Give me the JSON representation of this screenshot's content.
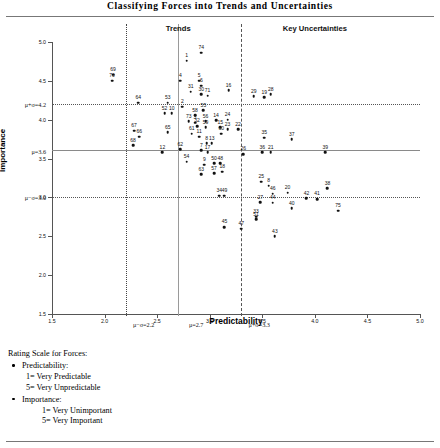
{
  "figure": {
    "title": "Classifying Forces into Trends and Uncertainties",
    "xaxis_title": "Predictability",
    "yaxis_title": "Importance"
  },
  "zones": [
    {
      "id": "trends",
      "label": "Trends"
    },
    {
      "id": "key-uncertainties",
      "label": "Key Uncertainties"
    }
  ],
  "footer": {
    "heading": "Rating Scale for Forces:",
    "items": [
      {
        "label": "Predictability:",
        "lines": [
          "1= Very Predictable",
          "5= Very Unpredictable"
        ],
        "indent": "sub"
      },
      {
        "label": "Importance:",
        "lines": [
          "1= Very Unimportant",
          "5= Very Important"
        ],
        "indent": "sub2"
      }
    ]
  },
  "chart_data": {
    "type": "scatter",
    "title": "Classifying Forces into Trends and Uncertainties",
    "xlabel": "Predictability",
    "ylabel": "Importance",
    "xlim": [
      1.5,
      5.0
    ],
    "ylim": [
      1.5,
      5.0
    ],
    "grid": false,
    "x_ticks": [
      "1.5",
      "2.0",
      "2.5",
      "3.0",
      "3.5",
      "4.0",
      "4.5",
      "5.0"
    ],
    "y_ticks": [
      "1.5",
      "2.0",
      "2.5",
      "3.0",
      "3.5",
      "4.0",
      "4.5",
      "5.0"
    ],
    "reference_lines": {
      "x": [
        {
          "label": "μ−σ=2.2",
          "value": 2.2,
          "style": "dotted"
        },
        {
          "label": "μ=2.7",
          "value": 2.7,
          "style": "solid"
        },
        {
          "label": "μ+σ=3.3",
          "value": 3.3,
          "style": "dashed"
        }
      ],
      "y": [
        {
          "label": "μ+σ=4.2",
          "value": 4.2,
          "style": "dotted"
        },
        {
          "label": "μ=3.6",
          "value": 3.6,
          "style": "solid"
        },
        {
          "label": "μ−σ=3.0",
          "value": 3.0,
          "style": "dotted"
        }
      ]
    },
    "points": [
      {
        "label": "69",
        "x": 2.08,
        "y": 4.58
      },
      {
        "label": "70",
        "x": 2.07,
        "y": 4.5
      },
      {
        "label": "64",
        "x": 2.32,
        "y": 4.22
      },
      {
        "label": "67",
        "x": 2.28,
        "y": 3.86
      },
      {
        "label": "66",
        "x": 2.33,
        "y": 3.78
      },
      {
        "label": "68",
        "x": 2.27,
        "y": 3.67
      },
      {
        "label": "12",
        "x": 2.55,
        "y": 3.58
      },
      {
        "label": "53",
        "x": 2.6,
        "y": 4.22
      },
      {
        "label": "52",
        "x": 2.57,
        "y": 4.08
      },
      {
        "label": "10",
        "x": 2.64,
        "y": 4.08
      },
      {
        "label": "65",
        "x": 2.6,
        "y": 3.84
      },
      {
        "label": "1",
        "x": 2.78,
        "y": 4.76
      },
      {
        "label": "74",
        "x": 2.92,
        "y": 4.86
      },
      {
        "label": "4",
        "x": 2.72,
        "y": 4.5
      },
      {
        "label": "5",
        "x": 2.9,
        "y": 4.5
      },
      {
        "label": "6",
        "x": 2.92,
        "y": 4.44
      },
      {
        "label": "31",
        "x": 2.82,
        "y": 4.36
      },
      {
        "label": "30",
        "x": 2.92,
        "y": 4.33
      },
      {
        "label": "71",
        "x": 2.98,
        "y": 4.31
      },
      {
        "label": "2",
        "x": 2.74,
        "y": 4.17
      },
      {
        "label": "55",
        "x": 2.94,
        "y": 4.12
      },
      {
        "label": "58",
        "x": 2.86,
        "y": 4.06
      },
      {
        "label": "73",
        "x": 2.8,
        "y": 3.98
      },
      {
        "label": "3",
        "x": 2.86,
        "y": 3.96
      },
      {
        "label": "32",
        "x": 2.88,
        "y": 3.92
      },
      {
        "label": "56",
        "x": 2.96,
        "y": 3.98
      },
      {
        "label": "59",
        "x": 2.96,
        "y": 3.9
      },
      {
        "label": "14",
        "x": 3.06,
        "y": 3.99
      },
      {
        "label": "24",
        "x": 3.17,
        "y": 4.0
      },
      {
        "label": "15",
        "x": 3.1,
        "y": 3.9
      },
      {
        "label": "23",
        "x": 3.17,
        "y": 3.88
      },
      {
        "label": "22",
        "x": 3.27,
        "y": 3.88
      },
      {
        "label": "60",
        "x": 3.11,
        "y": 3.82
      },
      {
        "label": "61",
        "x": 2.83,
        "y": 3.82
      },
      {
        "label": "11",
        "x": 2.9,
        "y": 3.78
      },
      {
        "label": "8",
        "x": 2.97,
        "y": 3.7
      },
      {
        "label": "13",
        "x": 3.02,
        "y": 3.7
      },
      {
        "label": "7",
        "x": 2.92,
        "y": 3.61
      },
      {
        "label": "17",
        "x": 2.98,
        "y": 3.58
      },
      {
        "label": "62",
        "x": 2.72,
        "y": 3.62
      },
      {
        "label": "54",
        "x": 2.78,
        "y": 3.46
      },
      {
        "label": "9",
        "x": 2.95,
        "y": 3.42
      },
      {
        "label": "63",
        "x": 2.92,
        "y": 3.3
      },
      {
        "label": "50",
        "x": 3.04,
        "y": 3.44
      },
      {
        "label": "48",
        "x": 3.1,
        "y": 3.44
      },
      {
        "label": "57",
        "x": 3.04,
        "y": 3.31
      },
      {
        "label": "18",
        "x": 3.12,
        "y": 3.33
      },
      {
        "label": "34",
        "x": 3.09,
        "y": 3.02
      },
      {
        "label": "49",
        "x": 3.14,
        "y": 3.02
      },
      {
        "label": "16",
        "x": 3.18,
        "y": 4.38
      },
      {
        "label": "29",
        "x": 3.42,
        "y": 4.3
      },
      {
        "label": "19",
        "x": 3.52,
        "y": 4.29
      },
      {
        "label": "28",
        "x": 3.58,
        "y": 4.33
      },
      {
        "label": "26",
        "x": 3.32,
        "y": 3.56
      },
      {
        "label": "35",
        "x": 3.52,
        "y": 3.77
      },
      {
        "label": "37",
        "x": 3.78,
        "y": 3.75
      },
      {
        "label": "36",
        "x": 3.5,
        "y": 3.58
      },
      {
        "label": "21",
        "x": 3.58,
        "y": 3.58
      },
      {
        "label": "39",
        "x": 4.1,
        "y": 3.58
      },
      {
        "label": "25",
        "x": 3.49,
        "y": 3.2
      },
      {
        "label": "8b",
        "x": 3.56,
        "y": 3.15
      },
      {
        "label": "46",
        "x": 3.6,
        "y": 3.05
      },
      {
        "label": "20",
        "x": 3.74,
        "y": 3.06
      },
      {
        "label": "42",
        "x": 3.92,
        "y": 2.99
      },
      {
        "label": "41",
        "x": 4.02,
        "y": 2.98
      },
      {
        "label": "38",
        "x": 4.12,
        "y": 3.12
      },
      {
        "label": "27",
        "x": 3.48,
        "y": 2.94
      },
      {
        "label": "44",
        "x": 3.6,
        "y": 2.93
      },
      {
        "label": "40",
        "x": 3.78,
        "y": 2.86
      },
      {
        "label": "75",
        "x": 4.22,
        "y": 2.83
      },
      {
        "label": "33",
        "x": 3.44,
        "y": 2.75
      },
      {
        "label": "45",
        "x": 3.14,
        "y": 2.62
      },
      {
        "label": "47",
        "x": 3.3,
        "y": 2.6
      },
      {
        "label": "43",
        "x": 3.62,
        "y": 2.5
      },
      {
        "label": "51",
        "x": 3.44,
        "y": 2.72
      }
    ]
  }
}
